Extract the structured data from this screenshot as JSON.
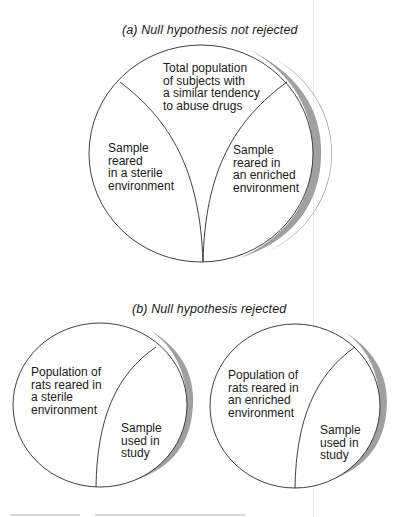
{
  "figure": {
    "panel_a": {
      "title": "(a) Null hypothesis not rejected",
      "regions": {
        "top": {
          "lines": [
            "Total population",
            "of subjects with",
            "a similar tendency",
            "to abuse drugs"
          ]
        },
        "left": {
          "lines": [
            "Sample",
            "reared",
            "in a sterile",
            "environment"
          ]
        },
        "right": {
          "lines": [
            "Sample",
            "reared in",
            "an enriched",
            "environment"
          ]
        }
      }
    },
    "panel_b": {
      "title": "(b) Null hypothesis rejected",
      "circles": [
        {
          "population_lines": [
            "Population of",
            "rats reared in",
            "a sterile",
            "environment"
          ],
          "sample_lines": [
            "Sample",
            "used in",
            "study"
          ]
        },
        {
          "population_lines": [
            "Population of",
            "rats reared in",
            "an enriched",
            "environment"
          ],
          "sample_lines": [
            "Sample",
            "used in",
            "study"
          ]
        }
      ]
    },
    "colors": {
      "outline": "#2a2a2a",
      "shadow": "#9a9a9a",
      "background": "#ffffff"
    }
  }
}
